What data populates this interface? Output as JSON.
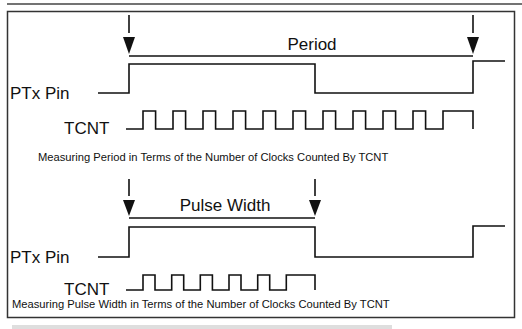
{
  "diagram": {
    "period_section": {
      "span_label": "Period",
      "pin_label": "PTx Pin",
      "clock_label": "TCNT",
      "clock_pulses": 11,
      "caption": "Measuring Period in Terms of the Number of Clocks Counted By TCNT"
    },
    "pulse_width_section": {
      "span_label": "Pulse Width",
      "pin_label": "PTx Pin",
      "clock_label": "TCNT",
      "clock_pulses": 6,
      "caption": "Measuring Pulse Width in Terms of the Number of Clocks Counted By TCNT"
    },
    "colors": {
      "line": "#1a1a1a",
      "background": "#ffffff",
      "frame": "#333333"
    }
  }
}
